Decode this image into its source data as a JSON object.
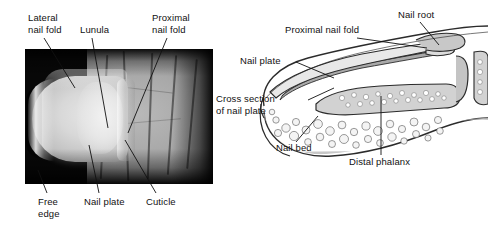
{
  "figure": {
    "background_color": "#ffffff",
    "text_color": "#111111",
    "panels": [
      {
        "id": "photo",
        "kind": "photograph",
        "subject": "fingernail photograph"
      },
      {
        "id": "diagram",
        "kind": "line-drawing",
        "subject": "sagittal cross section of fingertip"
      }
    ]
  },
  "photo_panel": {
    "labels": {
      "lateral_nail_fold": "Lateral\nnail fold",
      "lunula": "Lunula",
      "proximal_nail_fold": "Proximal\nnail fold",
      "free_edge": "Free\nedge",
      "nail_plate": "Nail plate",
      "cuticle": "Cuticle"
    },
    "image_alt": "Close-up photograph of a thumb showing the nail plate, lunula and surrounding skin folds"
  },
  "diagram_panel": {
    "labels": {
      "proximal_nail_fold": "Proximal nail fold",
      "nail_root": "Nail root",
      "nail_plate": "Nail plate",
      "cross_section_of_nail_plate": "Cross section\nof nail plate",
      "nail_bed": "Nail bed",
      "distal_phalanx": "Distal phalanx"
    },
    "image_alt": "Sagittal cross-section line drawing of a fingertip showing nail root, nail plate, nail bed and distal phalanx"
  },
  "colors": {
    "leader_line": "#111111",
    "photo_background": "#080808",
    "nail_plate_light": "#e6e6e6",
    "skin_mid": "#a8a8a8",
    "diagram_outline": "#2b2b2b",
    "diagram_tissue_fill": "#b5b5b5",
    "diagram_fat_fill": "#f2f2f2",
    "diagram_bone_fill": "#c9c9c9"
  }
}
